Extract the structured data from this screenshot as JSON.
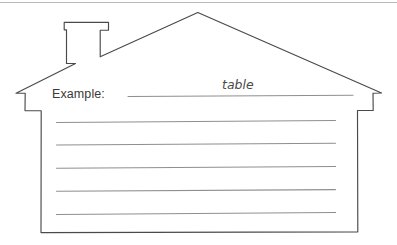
{
  "worksheet": {
    "title": "House outline writing template",
    "prompt_label": "Example:",
    "example_answer": "table",
    "blank_line_count": 5,
    "shape": "house-outline-with-chimney"
  },
  "colors": {
    "background": "#ffffff",
    "outline": "#4a4a4a",
    "rule_line": "#8f8f8f",
    "text": "#3a3a3a",
    "top_border": "#b9b9b9"
  },
  "icons": {
    "house": "house-outline-icon",
    "chimney": "chimney-icon"
  }
}
